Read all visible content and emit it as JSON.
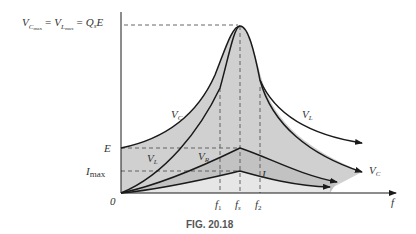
{
  "figure": {
    "caption": "FIG. 20.18",
    "top_equation": {
      "v": "V",
      "c_sub": "C",
      "max1": "max",
      "eq1": "=",
      "l_sub": "L",
      "max2": "max",
      "eq2": "=",
      "q": "Q",
      "s_sub": "s",
      "e": "E"
    },
    "axis": {
      "x_label": "f",
      "origin_label": "0",
      "y_ticks": [
        {
          "label": "E"
        },
        {
          "label": "I",
          "sub": "max"
        }
      ],
      "x_ticks": [
        {
          "label": "f",
          "sub": "1"
        },
        {
          "label": "f",
          "sub": "s"
        },
        {
          "label": "f",
          "sub": "2"
        }
      ]
    },
    "curve_labels": {
      "vc_left": {
        "main": "V",
        "sub": "C"
      },
      "vl_right": {
        "main": "V",
        "sub": "L"
      },
      "vl_left": {
        "main": "V",
        "sub": "L"
      },
      "vr": {
        "main": "V",
        "sub": "R"
      },
      "i": {
        "main": "I"
      },
      "vc_right": {
        "main": "V",
        "sub": "C"
      }
    },
    "colors": {
      "shade_dark": "#c8c8c8",
      "shade_light": "#e4e4e4",
      "curve": "#1a1a1a",
      "dash": "#555555"
    }
  }
}
